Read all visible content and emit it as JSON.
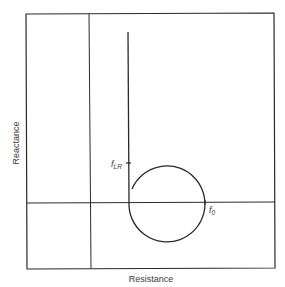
{
  "diagram": {
    "type": "impedance-plot",
    "axes": {
      "x_label": "Resistance",
      "y_label": "Reactance"
    },
    "annotations": {
      "f_lr": {
        "main": "f",
        "sub": "LR"
      },
      "f_0": {
        "main": "f",
        "sub": "0"
      }
    },
    "colors": {
      "line": "#2a2a2a",
      "text": "#3a3a3a",
      "background": "#ffffff"
    }
  }
}
